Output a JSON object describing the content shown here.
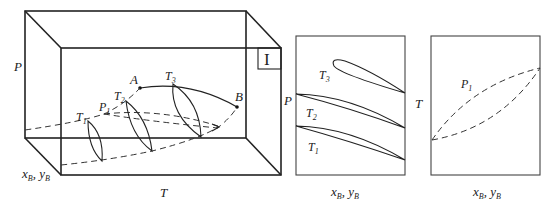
{
  "figure": {
    "panel_3d": {
      "axis_labels": {
        "p": "P",
        "t": "T",
        "xy": "x",
        "xy_sub_b": "B",
        "xy_sep": ", y",
        "xy_sub_b2": "B"
      },
      "region_label": "I",
      "points": {
        "a": "A",
        "b": "B"
      },
      "isotherm_labels": {
        "t1": "T",
        "t1_sub": "1",
        "t2": "T",
        "t2_sub": "2",
        "t3": "T",
        "t3_sub": "3"
      },
      "isobar_label": {
        "p1": "P",
        "p1_sub": "1"
      }
    },
    "panel_px": {
      "axis_labels": {
        "y": "P",
        "x": "x",
        "x_sub": "B",
        "x_sep": ", y",
        "x_sub2": "B"
      },
      "curve_labels": {
        "t3": "T",
        "t3_sub": "3",
        "t2": "T",
        "t2_sub": "2",
        "t1": "T",
        "t1_sub": "1"
      }
    },
    "panel_tx": {
      "axis_labels": {
        "y": "T",
        "x": "x",
        "x_sub": "B",
        "x_sep": ", y",
        "x_sub2": "B"
      },
      "curve_labels": {
        "p1": "P",
        "p1_sub": "1"
      }
    }
  }
}
